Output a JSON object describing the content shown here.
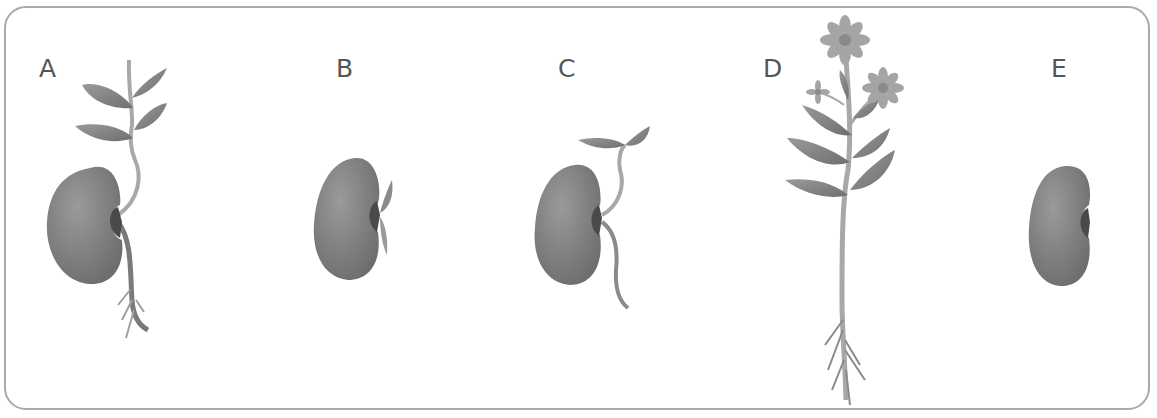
{
  "diagram": {
    "type": "germination-stages",
    "colors": {
      "seed": "#7a7a7a",
      "seed_light": "#9a9a9a",
      "hilum": "#4a4a4a",
      "stem": "#a8a8a8",
      "leaf": "#858585",
      "flower": "#9b9b9b",
      "border": "#a9a9a9",
      "label": "#555555"
    },
    "panels": [
      {
        "label": "A",
        "depicts": "seed with seedling, leaves and roots"
      },
      {
        "label": "B",
        "depicts": "seed with emerging shoot"
      },
      {
        "label": "C",
        "depicts": "seed with sprout and root"
      },
      {
        "label": "D",
        "depicts": "mature flowering plant with roots"
      },
      {
        "label": "E",
        "depicts": "dormant seed"
      }
    ]
  }
}
